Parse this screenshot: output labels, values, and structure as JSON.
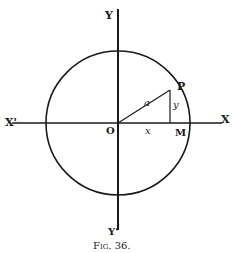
{
  "figure": {
    "caption": "Fig. 36.",
    "labels": {
      "y_top": "Y",
      "y_bottom": "Y'",
      "x_left": "X'",
      "x_right": "X",
      "origin": "O",
      "point_p": "P",
      "point_m": "M",
      "radius": "a",
      "x_segment": "x",
      "y_segment": "y"
    },
    "geometry": {
      "center": [
        118,
        123
      ],
      "radius": 72,
      "point_p": [
        170,
        84
      ],
      "point_m": [
        170,
        123
      ]
    },
    "colors": {
      "ink": "#1a1a1a",
      "background": "#ffffff"
    }
  }
}
